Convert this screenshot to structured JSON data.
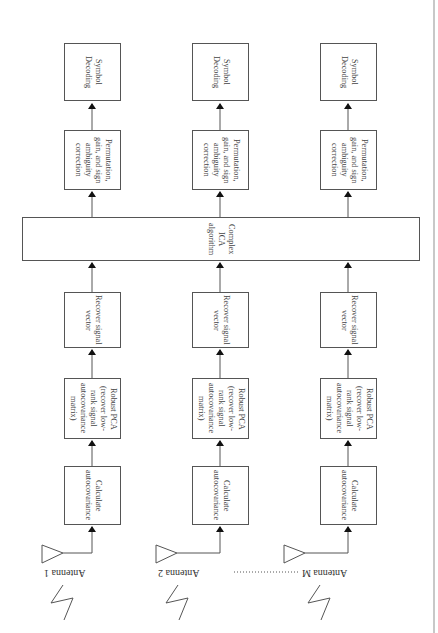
{
  "diagram": {
    "orientation": "rotated-90",
    "channels": [
      {
        "antenna": "Antenna 1",
        "blocks": {
          "calc": "Calculate\nautocovariance",
          "rpca": "Robust PCA\n(recover low-\nrank signal\nautocovariance\nmatrix)",
          "recover": "Recover signal\nvector",
          "perm": "Permutation,\ngain, and sign\nambiguity\ncorrection",
          "decode": "Symbol\nDecoding"
        }
      },
      {
        "antenna": "Antenna 2",
        "blocks": {
          "calc": "Calculate\nautocovariance",
          "rpca": "Robust PCA\n(recover low-\nrank signal\nautocovariance\nmatrix)",
          "recover": "Recover signal\nvector",
          "perm": "Permutation,\ngain, and sign\nambiguity\ncorrection",
          "decode": "Symbol\nDecoding"
        }
      },
      {
        "antenna": "Antenna M",
        "blocks": {
          "calc": "Calculate\nautocovariance",
          "rpca": "Robust PCA\n(recover low-\nrank signal\nautocovariance\nmatrix)",
          "recover": "Recover signal\nvector",
          "perm": "Permutation,\ngain, and sign\nambiguity\ncorrection",
          "decode": "Symbol\nDecoding"
        }
      }
    ],
    "shared_block": "Complex\nICA\nalgorithm",
    "ellipsis": "dotted-line"
  }
}
